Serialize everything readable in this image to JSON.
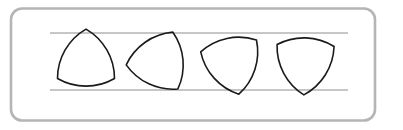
{
  "figure": {
    "background_color": "#ffffff",
    "frame": {
      "name": "rounded-frame",
      "x": 11,
      "y": 8.5,
      "width": 364,
      "height": 112,
      "radius": 11,
      "stroke_color": "#b5b5b5",
      "stroke_width": 2.6,
      "fill": "#ffffff"
    },
    "guide_lines": {
      "stroke_color": "#8e8e8e",
      "stroke_width": 1,
      "x_start": 50,
      "x_end": 348,
      "lines": [
        {
          "name": "top-guide-line",
          "y": 33
        },
        {
          "name": "bottom-guide-line",
          "y": 90
        }
      ]
    },
    "shapes": {
      "type": "reuleaux-triangle",
      "count": 4,
      "stroke_color": "#1a1a1a",
      "stroke_width": 1.6,
      "fill": "none",
      "width_constant": 57,
      "items": [
        {
          "name": "reuleaux-triangle-1",
          "label": "rotation-0",
          "rotation_deg": 0,
          "center_x": 86,
          "center_y": 62,
          "apex_position": "top"
        },
        {
          "name": "reuleaux-triangle-2",
          "label": "rotation-25",
          "rotation_deg": 25,
          "center_x": 159,
          "center_y": 62,
          "apex_position": "top-right"
        },
        {
          "name": "reuleaux-triangle-3",
          "label": "rotation-48",
          "rotation_deg": 48,
          "center_x": 232,
          "center_y": 62,
          "apex_position": "right"
        },
        {
          "name": "reuleaux-triangle-4",
          "label": "rotation-62",
          "rotation_deg": 62,
          "center_x": 305,
          "center_y": 62,
          "apex_position": "bottom"
        }
      ]
    }
  }
}
